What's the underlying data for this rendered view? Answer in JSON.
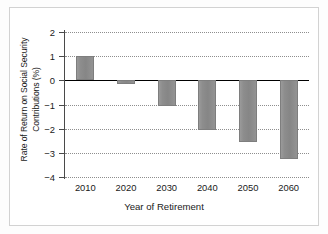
{
  "chart_data": {
    "type": "bar",
    "title": "",
    "xlabel": "Year of Retirement",
    "ylabel_line1": "Rate of Return on Social Security",
    "ylabel_line2": "Contributions (%)",
    "categories": [
      "2010",
      "2020",
      "2030",
      "2040",
      "2050",
      "2060"
    ],
    "values": [
      1.0,
      -0.15,
      -1.05,
      -2.05,
      -2.55,
      -3.25
    ],
    "ylim": [
      -4,
      2
    ],
    "yticks": [
      2,
      1,
      0,
      -1,
      -2,
      -3,
      -4
    ],
    "ytick_labels": [
      "2",
      "1",
      "0",
      "−1",
      "−2",
      "−3",
      "−4"
    ],
    "grid": true,
    "grid_style": "dotted",
    "legend": "none",
    "bar_color": "#8d8d8d",
    "baseline_color": "#000000",
    "axis_color": "#4a4a4a"
  }
}
